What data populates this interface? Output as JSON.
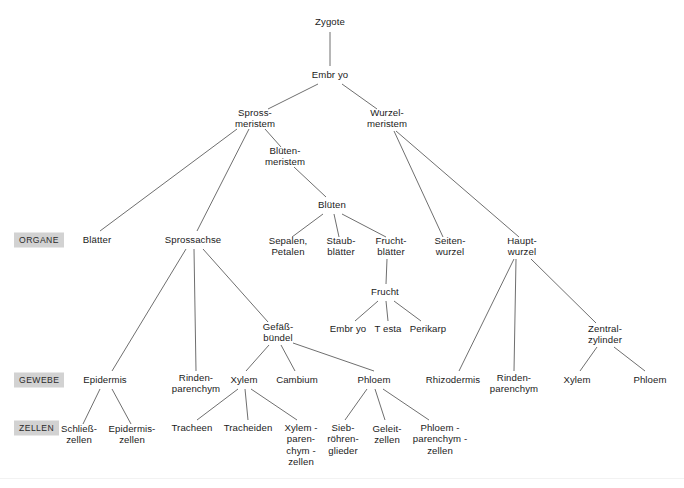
{
  "figure": {
    "background_color": "#ffffff",
    "line_color": "#6f6f6f",
    "text_color": "#1b1b1b",
    "badge_color": "#d2d2d2"
  },
  "tiers": [
    {
      "id": "organe",
      "label": "ORGANE",
      "x": 14,
      "y": 240
    },
    {
      "id": "gewebe",
      "label": "GEWEBE",
      "x": 14,
      "y": 380
    },
    {
      "id": "zellen",
      "label": "ZELLEN",
      "x": 14,
      "y": 428
    }
  ],
  "nodes": [
    {
      "id": "zygote",
      "label": "Zygote",
      "x": 330,
      "y": 22
    },
    {
      "id": "embryo",
      "label": "Embr yo",
      "x": 330,
      "y": 75
    },
    {
      "id": "sprossmeristem",
      "label": "Spross-\nmeristem",
      "x": 255,
      "y": 118
    },
    {
      "id": "wurzelmeristem",
      "label": "Wurzel-\nmeristem",
      "x": 387,
      "y": 118
    },
    {
      "id": "bluetenmeristem",
      "label": "Blüten-\nmeristem",
      "x": 285,
      "y": 156
    },
    {
      "id": "blueten",
      "label": "Blüten",
      "x": 332,
      "y": 205
    },
    {
      "id": "blaetter",
      "label": "Blätter",
      "x": 97,
      "y": 240
    },
    {
      "id": "sprossachse",
      "label": "Sprossachse",
      "x": 193,
      "y": 240
    },
    {
      "id": "sepalen_petalen",
      "label": "Sepalen,\nPetalen",
      "x": 288,
      "y": 246
    },
    {
      "id": "staubblaetter",
      "label": "Staub-\nblätter",
      "x": 341,
      "y": 246
    },
    {
      "id": "fruchtblaetter",
      "label": "Frucht-\nblätter",
      "x": 391,
      "y": 246
    },
    {
      "id": "seitenwurzel",
      "label": "Seiten-\nwurzel",
      "x": 450,
      "y": 246
    },
    {
      "id": "hauptwurzel",
      "label": "Haupt-\nwurzel",
      "x": 522,
      "y": 246
    },
    {
      "id": "frucht",
      "label": "Frucht",
      "x": 385,
      "y": 292
    },
    {
      "id": "gefaessbuendel",
      "label": "Gefäß-\nbündel",
      "x": 278,
      "y": 332
    },
    {
      "id": "frucht_embryo",
      "label": "Embr yo",
      "x": 348,
      "y": 329
    },
    {
      "id": "testa",
      "label": "T esta",
      "x": 388,
      "y": 329
    },
    {
      "id": "perikarp",
      "label": "Perikarp",
      "x": 428,
      "y": 329
    },
    {
      "id": "zentralzylinder",
      "label": "Zentral-\nzylinder",
      "x": 605,
      "y": 334
    },
    {
      "id": "epidermis",
      "label": "Epidermis",
      "x": 105,
      "y": 380
    },
    {
      "id": "rindenparenchym_spross",
      "label": "Rinden-\nparenchym",
      "x": 196,
      "y": 383
    },
    {
      "id": "xylem_spross",
      "label": "Xylem",
      "x": 244,
      "y": 380
    },
    {
      "id": "cambium",
      "label": "Cambium",
      "x": 297,
      "y": 380
    },
    {
      "id": "phloem_spross",
      "label": "Phloem",
      "x": 374,
      "y": 380
    },
    {
      "id": "rhizodermis",
      "label": "Rhizodermis",
      "x": 453,
      "y": 380
    },
    {
      "id": "rindenparenchym_wurzel",
      "label": "Rinden-\nparenchym",
      "x": 514,
      "y": 383
    },
    {
      "id": "xylem_wurzel",
      "label": "Xylem",
      "x": 577,
      "y": 380
    },
    {
      "id": "phloem_wurzel",
      "label": "Phloem",
      "x": 650,
      "y": 380
    },
    {
      "id": "schliesszellen",
      "label": "Schließ-\nzellen",
      "x": 79,
      "y": 434
    },
    {
      "id": "epidermiszellen",
      "label": "Epidermis-\nzellen",
      "x": 132,
      "y": 434
    },
    {
      "id": "tracheen",
      "label": "Tracheen",
      "x": 192,
      "y": 428
    },
    {
      "id": "tracheiden",
      "label": "Tracheiden",
      "x": 248,
      "y": 428
    },
    {
      "id": "xylemparenchymzellen",
      "label": "Xylem -\nparen-\nchym -\nzellen",
      "x": 301,
      "y": 445
    },
    {
      "id": "siebroehrenglieder",
      "label": "Sieb-\nröhren-\nglieder",
      "x": 343,
      "y": 439
    },
    {
      "id": "geleitzellen",
      "label": "Geleit-\nzellen",
      "x": 387,
      "y": 434
    },
    {
      "id": "phloemparenchymzellen",
      "label": "Phloem -\nparenchym -\nzellen",
      "x": 440,
      "y": 439
    }
  ],
  "edges": [
    {
      "from": "zygote",
      "to": "embryo",
      "x1": 330,
      "y1": 32,
      "x2": 330,
      "y2": 66
    },
    {
      "from": "embryo",
      "to": "sprossmeristem",
      "x1": 318,
      "y1": 84,
      "x2": 268,
      "y2": 109
    },
    {
      "from": "embryo",
      "to": "wurzelmeristem",
      "x1": 342,
      "y1": 84,
      "x2": 377,
      "y2": 109
    },
    {
      "from": "sprossmeristem",
      "to": "blaetter",
      "x1": 237,
      "y1": 129,
      "x2": 100,
      "y2": 231
    },
    {
      "from": "sprossmeristem",
      "to": "sprossachse",
      "x1": 249,
      "y1": 129,
      "x2": 197,
      "y2": 231
    },
    {
      "from": "sprossmeristem",
      "to": "bluetenmeristem",
      "x1": 265,
      "y1": 129,
      "x2": 281,
      "y2": 147
    },
    {
      "from": "bluetenmeristem",
      "to": "blueten",
      "x1": 294,
      "y1": 167,
      "x2": 326,
      "y2": 197
    },
    {
      "from": "blueten",
      "to": "sepalen_petalen",
      "x1": 323,
      "y1": 214,
      "x2": 292,
      "y2": 237
    },
    {
      "from": "blueten",
      "to": "staubblaetter",
      "x1": 334,
      "y1": 214,
      "x2": 339,
      "y2": 237
    },
    {
      "from": "blueten",
      "to": "fruchtblaetter",
      "x1": 342,
      "y1": 214,
      "x2": 386,
      "y2": 237
    },
    {
      "from": "fruchtblaetter",
      "to": "frucht",
      "x1": 387,
      "y1": 259,
      "x2": 386,
      "y2": 284
    },
    {
      "from": "frucht",
      "to": "frucht_embryo",
      "x1": 378,
      "y1": 301,
      "x2": 355,
      "y2": 321
    },
    {
      "from": "frucht",
      "to": "testa",
      "x1": 386,
      "y1": 301,
      "x2": 388,
      "y2": 321
    },
    {
      "from": "frucht",
      "to": "perikarp",
      "x1": 394,
      "y1": 301,
      "x2": 421,
      "y2": 321
    },
    {
      "from": "wurzelmeristem",
      "to": "seitenwurzel",
      "x1": 394,
      "y1": 131,
      "x2": 443,
      "y2": 237
    },
    {
      "from": "wurzelmeristem",
      "to": "hauptwurzel",
      "x1": 396,
      "y1": 131,
      "x2": 519,
      "y2": 237
    },
    {
      "from": "sprossachse",
      "to": "epidermis",
      "x1": 186,
      "y1": 249,
      "x2": 112,
      "y2": 371
    },
    {
      "from": "sprossachse",
      "to": "rindenparenchym_spross",
      "x1": 194,
      "y1": 249,
      "x2": 196,
      "y2": 371
    },
    {
      "from": "sprossachse",
      "to": "gefaessbuendel",
      "x1": 203,
      "y1": 249,
      "x2": 268,
      "y2": 322
    },
    {
      "from": "gefaessbuendel",
      "to": "xylem_spross",
      "x1": 269,
      "y1": 345,
      "x2": 246,
      "y2": 371
    },
    {
      "from": "gefaessbuendel",
      "to": "cambium",
      "x1": 281,
      "y1": 345,
      "x2": 295,
      "y2": 371
    },
    {
      "from": "gefaessbuendel",
      "to": "phloem_spross",
      "x1": 293,
      "y1": 343,
      "x2": 374,
      "y2": 371
    },
    {
      "from": "epidermis",
      "to": "schliesszellen",
      "x1": 100,
      "y1": 389,
      "x2": 83,
      "y2": 424
    },
    {
      "from": "epidermis",
      "to": "epidermiszellen",
      "x1": 112,
      "y1": 389,
      "x2": 131,
      "y2": 424
    },
    {
      "from": "xylem_spross",
      "to": "tracheen",
      "x1": 238,
      "y1": 389,
      "x2": 197,
      "y2": 420
    },
    {
      "from": "xylem_spross",
      "to": "tracheiden",
      "x1": 245,
      "y1": 389,
      "x2": 248,
      "y2": 420
    },
    {
      "from": "xylem_spross",
      "to": "xylemparenchymzellen",
      "x1": 251,
      "y1": 389,
      "x2": 297,
      "y2": 420
    },
    {
      "from": "phloem_spross",
      "to": "siebroehrenglieder",
      "x1": 367,
      "y1": 389,
      "x2": 345,
      "y2": 420
    },
    {
      "from": "phloem_spross",
      "to": "geleitzellen",
      "x1": 375,
      "y1": 389,
      "x2": 385,
      "y2": 420
    },
    {
      "from": "phloem_spross",
      "to": "phloemparenchymzellen",
      "x1": 383,
      "y1": 389,
      "x2": 429,
      "y2": 420
    },
    {
      "from": "hauptwurzel",
      "to": "rhizodermis",
      "x1": 514,
      "y1": 259,
      "x2": 459,
      "y2": 371
    },
    {
      "from": "hauptwurzel",
      "to": "rindenparenchym_wurzel",
      "x1": 516,
      "y1": 259,
      "x2": 514,
      "y2": 371
    },
    {
      "from": "hauptwurzel",
      "to": "zentralzylinder",
      "x1": 531,
      "y1": 259,
      "x2": 596,
      "y2": 323
    },
    {
      "from": "zentralzylinder",
      "to": "xylem_wurzel",
      "x1": 597,
      "y1": 347,
      "x2": 580,
      "y2": 371
    },
    {
      "from": "zentralzylinder",
      "to": "phloem_wurzel",
      "x1": 614,
      "y1": 347,
      "x2": 645,
      "y2": 371
    }
  ]
}
